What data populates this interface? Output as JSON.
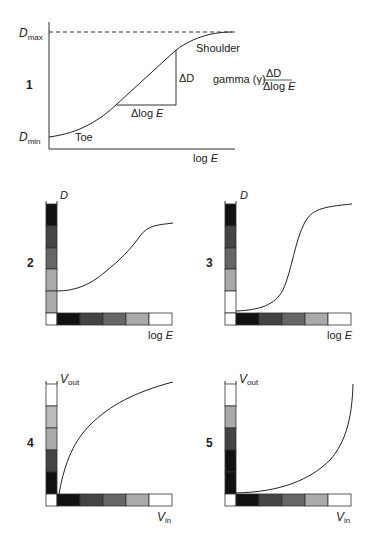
{
  "figure": {
    "panels": [
      {
        "number": "1",
        "labels": {
          "dmax_main": "D",
          "dmax_sub": "max",
          "dmin_main": "D",
          "dmin_sub": "min",
          "shoulder": "Shoulder",
          "toe": "Toe",
          "delta_d": "ΔD",
          "delta_log_e": "Δlog ",
          "delta_log_e_italic": "E",
          "gamma_text": "gamma (γ)",
          "gamma_num": "ΔD",
          "gamma_den": "Δlog ",
          "gamma_den_italic": "E",
          "xaxis": "log ",
          "xaxis_italic": "E"
        }
      },
      {
        "number": "2",
        "labels": {
          "yaxis": "D",
          "xaxis": "log ",
          "xaxis_italic": "E"
        },
        "vertical_bar": [
          "#111111",
          "#444444",
          "#666666",
          "#aaaaaa",
          "#aaaaaa"
        ],
        "horizontal_bar": [
          "#ffffff",
          "#111111",
          "#444444",
          "#666666",
          "#aaaaaa",
          "#ffffff"
        ]
      },
      {
        "number": "3",
        "labels": {
          "yaxis": "D",
          "xaxis": "log ",
          "xaxis_italic": "E"
        },
        "vertical_bar": [
          "#111111",
          "#444444",
          "#666666",
          "#aaaaaa",
          "#ffffff"
        ],
        "horizontal_bar": [
          "#ffffff",
          "#111111",
          "#444444",
          "#666666",
          "#aaaaaa",
          "#ffffff"
        ]
      },
      {
        "number": "4",
        "labels": {
          "yaxis": "V",
          "yaxis_sub": "out",
          "xaxis": "V",
          "xaxis_sub": "in"
        },
        "vertical_bar": [
          "#ffffff",
          "#bbbbbb",
          "#aaaaaa",
          "#444444",
          "#111111"
        ],
        "horizontal_bar": [
          "#ffffff",
          "#111111",
          "#444444",
          "#666666",
          "#aaaaaa",
          "#ffffff"
        ]
      },
      {
        "number": "5",
        "labels": {
          "yaxis": "V",
          "yaxis_sub": "out",
          "xaxis": "V",
          "xaxis_sub": "in"
        },
        "vertical_bar": [
          "#ffffff",
          "#aaaaaa",
          "#444444",
          "#111111",
          "#111111"
        ],
        "horizontal_bar": [
          "#ffffff",
          "#111111",
          "#444444",
          "#666666",
          "#aaaaaa",
          "#ffffff"
        ]
      }
    ]
  }
}
